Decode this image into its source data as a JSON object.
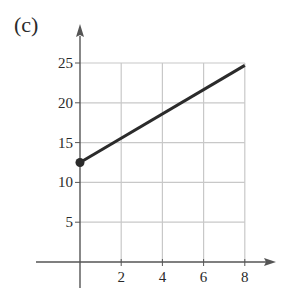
{
  "panel_label": "(c)",
  "chart_data": {
    "type": "line",
    "title": "",
    "xlabel": "",
    "ylabel": "",
    "x_ticks": [
      2,
      4,
      6,
      8
    ],
    "y_ticks": [
      5,
      10,
      15,
      20,
      25
    ],
    "xlim": [
      0,
      8
    ],
    "ylim": [
      0,
      25
    ],
    "grid": true,
    "legend": null,
    "series": [
      {
        "name": "line",
        "x": [
          0,
          8
        ],
        "y": [
          12.5,
          24.7
        ],
        "start_marker": "filled-dot"
      }
    ],
    "colors": {
      "line": "#2b2b2b",
      "axis": "#555555",
      "grid": "#c8c8c8",
      "text": "#2a2a2a"
    }
  }
}
